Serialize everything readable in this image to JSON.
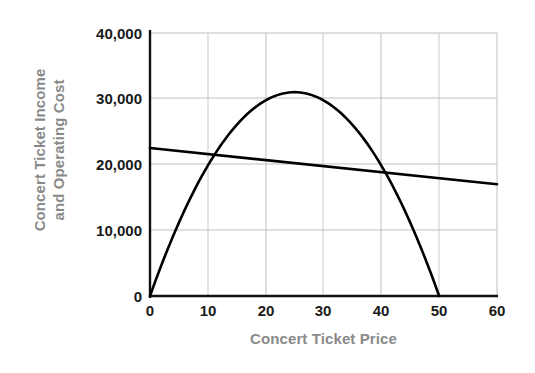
{
  "chart_data": {
    "type": "line",
    "title": "",
    "xlabel": "Concert Ticket Price",
    "ylabel": "Concert Ticket Income and Operating Cost",
    "ylabel_lines": [
      "Concert Ticket Income",
      "and Operating Cost"
    ],
    "xlim": [
      0,
      60
    ],
    "ylim": [
      0,
      40000
    ],
    "xticks": [
      0,
      10,
      20,
      30,
      40,
      50,
      60
    ],
    "xtick_labels": [
      "0",
      "10",
      "20",
      "30",
      "40",
      "50",
      "60"
    ],
    "yticks": [
      0,
      10000,
      20000,
      30000,
      40000
    ],
    "ytick_labels": [
      "0",
      "10,000",
      "20,000",
      "30,000",
      "40,000"
    ],
    "grid": true,
    "legend": "none",
    "series": [
      {
        "name": "Concert Ticket Income",
        "shape": "parabola",
        "color": "#000000",
        "x": [
          0,
          5,
          10,
          15,
          20,
          25,
          30,
          35,
          40,
          45,
          50
        ],
        "values": [
          0,
          11160,
          19840,
          26040,
          29760,
          31000,
          29760,
          26040,
          19840,
          11160,
          0
        ]
      },
      {
        "name": "Operating Cost",
        "shape": "line",
        "color": "#000000",
        "x": [
          0,
          60
        ],
        "values": [
          22500,
          17000
        ]
      }
    ],
    "annotations": {
      "income_peak": {
        "x": 25,
        "y": 31000
      },
      "income_zero_right": {
        "x": 50,
        "y": 0
      },
      "break_even_left": {
        "x": 10,
        "y": 21600
      },
      "break_even_right": {
        "x": 42,
        "y": 18650
      }
    },
    "colors": {
      "axis": "#1a1a1a",
      "grid": "#bfbfbf",
      "curve": "#000000",
      "tick_label": "#1a1a1a",
      "axis_title": "#8a8a8a",
      "background": "#ffffff"
    }
  }
}
